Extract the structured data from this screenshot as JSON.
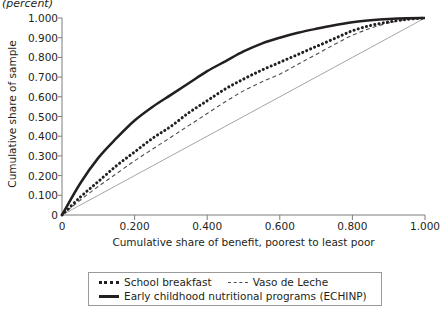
{
  "unit_note": "(percent)",
  "axes": {
    "y_title": "Cumulative share of sample",
    "x_title": "Cumulative share of benefit, poorest to least poor",
    "y_ticks": [
      "0",
      "0.100",
      "0.200",
      "0.300",
      "0.400",
      "0.500",
      "0.600",
      "0.700",
      "0.800",
      "0.900",
      "1.000"
    ],
    "x_ticks": [
      "0",
      "0.200",
      "0.400",
      "0.600",
      "0.800",
      "1.000"
    ]
  },
  "legend": {
    "items": [
      {
        "label": "School breakfast",
        "style": "dotted"
      },
      {
        "label": "Vaso de Leche",
        "style": "dashed"
      },
      {
        "label": "Early childhood nutritional programs (ECHINP)",
        "style": "solid"
      }
    ]
  },
  "colors": {
    "ink": "#231f20",
    "axis": "#7d7d7d",
    "diagonal": "#9a9a9a",
    "dashed_line": "#4d4d4d"
  },
  "chart_data": {
    "type": "line",
    "title": "",
    "subtitle": "(percent)",
    "xlabel": "Cumulative share of benefit, poorest to least poor",
    "ylabel": "Cumulative share of sample",
    "xlim": [
      0,
      1.0
    ],
    "ylim": [
      0,
      1.0
    ],
    "grid": false,
    "legend_position": "bottom",
    "x": [
      0.0,
      0.05,
      0.1,
      0.15,
      0.2,
      0.25,
      0.3,
      0.35,
      0.4,
      0.45,
      0.5,
      0.55,
      0.6,
      0.65,
      0.7,
      0.75,
      0.8,
      0.85,
      0.9,
      0.95,
      1.0
    ],
    "series": [
      {
        "name": "Early childhood nutritional programs (ECHINP)",
        "style": "solid",
        "values": [
          0.0,
          0.16,
          0.29,
          0.39,
          0.48,
          0.55,
          0.61,
          0.67,
          0.73,
          0.78,
          0.83,
          0.87,
          0.9,
          0.925,
          0.945,
          0.963,
          0.978,
          0.988,
          0.995,
          0.999,
          1.0
        ]
      },
      {
        "name": "School breakfast",
        "style": "dotted",
        "values": [
          0.0,
          0.09,
          0.17,
          0.25,
          0.32,
          0.39,
          0.45,
          0.52,
          0.58,
          0.64,
          0.69,
          0.735,
          0.775,
          0.815,
          0.855,
          0.895,
          0.935,
          0.962,
          0.98,
          0.993,
          1.0
        ]
      },
      {
        "name": "Vaso de Leche",
        "style": "dashed",
        "values": [
          0.0,
          0.075,
          0.145,
          0.21,
          0.275,
          0.335,
          0.395,
          0.455,
          0.515,
          0.575,
          0.63,
          0.675,
          0.715,
          0.765,
          0.815,
          0.865,
          0.912,
          0.948,
          0.975,
          0.992,
          1.0
        ]
      },
      {
        "name": "equality-diagonal",
        "style": "thin-solid",
        "values": [
          0.0,
          0.05,
          0.1,
          0.15,
          0.2,
          0.25,
          0.3,
          0.35,
          0.4,
          0.45,
          0.5,
          0.55,
          0.6,
          0.65,
          0.7,
          0.75,
          0.8,
          0.85,
          0.9,
          0.95,
          1.0
        ]
      }
    ]
  }
}
